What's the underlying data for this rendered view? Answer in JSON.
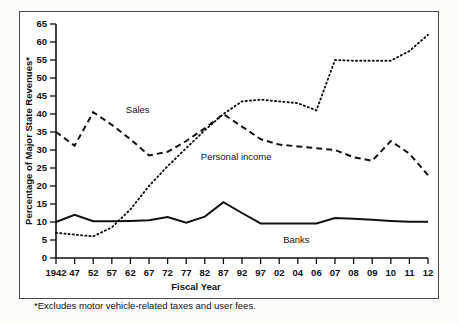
{
  "chart_data": {
    "type": "line",
    "title": "",
    "xlabel": "Fiscal Year",
    "ylabel": "Percentage of Major State Revenues*",
    "footnote": "*Excludes motor vehicle-related taxes and user fees.",
    "ylim": [
      0,
      65
    ],
    "yticks": [
      0,
      5,
      10,
      15,
      20,
      25,
      30,
      35,
      40,
      45,
      50,
      55,
      60,
      65
    ],
    "ytick_labels": [
      "0",
      "5",
      "10",
      "15",
      "20",
      "25",
      "30",
      "35",
      "40",
      "45",
      "50",
      "55",
      "60",
      "65"
    ],
    "grid": false,
    "legend": "inline-annotations",
    "categories": [
      "1942",
      "47",
      "52",
      "57",
      "62",
      "67",
      "72",
      "77",
      "82",
      "87",
      "92",
      "97",
      "02",
      "04",
      "06",
      "07",
      "08",
      "09",
      "10",
      "11",
      "12"
    ],
    "series": [
      {
        "name": "Sales",
        "style": "dashed",
        "color": "#111111",
        "label_x_index": 3,
        "values": [
          35.0,
          31.2,
          40.5,
          37.0,
          33.0,
          28.5,
          29.5,
          32.5,
          36.0,
          40.0,
          36.5,
          33.0,
          31.5,
          31.0,
          30.5,
          30.0,
          28.0,
          27.0,
          32.5,
          29.0,
          23.0
        ]
      },
      {
        "name": "Personal income",
        "style": "dotted",
        "color": "#111111",
        "label_x_index": 8,
        "values": [
          7.0,
          6.5,
          6.0,
          8.5,
          13.5,
          20.0,
          25.5,
          30.5,
          35.5,
          40.0,
          43.5,
          44.0,
          43.5,
          43.0,
          41.0,
          55.0,
          54.8,
          54.8,
          54.8,
          57.5,
          62.0
        ]
      },
      {
        "name": "Banks",
        "style": "solid",
        "color": "#111111",
        "label_x_index": 12,
        "values": [
          10.0,
          12.0,
          10.2,
          10.2,
          10.3,
          10.5,
          11.4,
          9.8,
          11.5,
          15.5,
          12.5,
          9.6,
          9.6,
          9.6,
          9.6,
          11.1,
          10.9,
          10.6,
          10.3,
          10.1,
          10.1
        ]
      }
    ]
  },
  "annotations": {
    "sales_label": "Sales",
    "personal_income_label": "Personal income",
    "banks_label": "Banks"
  },
  "axes": {
    "x_title": "Fiscal Year",
    "y_title": "Percentage of Major State Revenues*"
  },
  "footnote": {
    "text": "*Excludes motor vehicle-related taxes and user fees."
  }
}
